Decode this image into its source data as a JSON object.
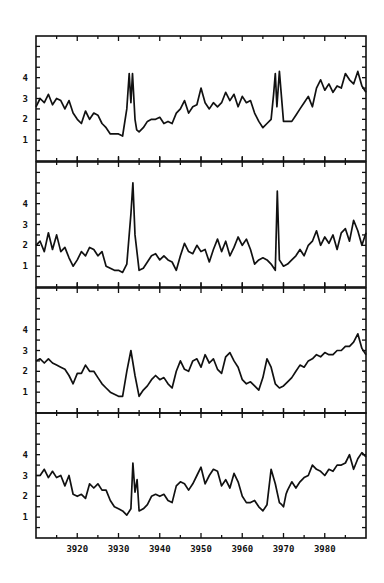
{
  "chart_data": [
    {
      "type": "line",
      "panel": 1,
      "title": "",
      "xlabel": "",
      "ylabel": "",
      "xlim": [
        3910,
        3990
      ],
      "ylim": [
        0,
        6
      ],
      "yticks": [
        1,
        2,
        3,
        4
      ],
      "x": [
        3910,
        3911,
        3912,
        3913,
        3914,
        3915,
        3916,
        3917,
        3918,
        3919,
        3920,
        3921,
        3922,
        3923,
        3924,
        3925,
        3926,
        3927,
        3928,
        3929,
        3930,
        3931,
        3932,
        3932.6,
        3933,
        3933.4,
        3934,
        3934.4,
        3935,
        3936,
        3937,
        3938,
        3939,
        3940,
        3941,
        3942,
        3943,
        3944,
        3945,
        3946,
        3947,
        3948,
        3949,
        3950,
        3951,
        3952,
        3953,
        3954,
        3955,
        3956,
        3957,
        3958,
        3959,
        3960,
        3961,
        3962,
        3963,
        3964,
        3965,
        3966,
        3967,
        3967.6,
        3968,
        3968.4,
        3969,
        3970,
        3971,
        3972,
        3973,
        3974,
        3975,
        3976,
        3977,
        3978,
        3979,
        3980,
        3981,
        3982,
        3983,
        3984,
        3985,
        3986,
        3987,
        3988,
        3989,
        3990
      ],
      "values": [
        2.6,
        3.0,
        2.8,
        3.2,
        2.7,
        3.0,
        2.9,
        2.5,
        2.9,
        2.3,
        2.0,
        1.8,
        2.4,
        2.0,
        2.3,
        2.2,
        1.8,
        1.6,
        1.3,
        1.3,
        1.3,
        1.2,
        2.5,
        4.2,
        2.8,
        4.2,
        2.0,
        1.5,
        1.4,
        1.6,
        1.9,
        2.0,
        2.0,
        2.1,
        1.8,
        1.9,
        1.8,
        2.3,
        2.5,
        2.9,
        2.3,
        2.6,
        2.7,
        3.5,
        2.8,
        2.5,
        2.8,
        2.6,
        2.8,
        3.3,
        2.9,
        3.2,
        2.6,
        3.1,
        2.8,
        2.9,
        2.3,
        1.9,
        1.6,
        1.8,
        2.0,
        3.2,
        4.2,
        2.6,
        4.3,
        1.9,
        1.9,
        1.9,
        2.2,
        2.5,
        2.8,
        3.1,
        2.6,
        3.5,
        3.9,
        3.4,
        3.7,
        3.3,
        3.6,
        3.5,
        4.2,
        3.9,
        3.7,
        4.3,
        3.6,
        3.3
      ]
    },
    {
      "type": "line",
      "panel": 2,
      "xlim": [
        3910,
        3990
      ],
      "ylim": [
        0,
        6
      ],
      "yticks": [
        1,
        2,
        3,
        4
      ],
      "x": [
        3910,
        3911,
        3912,
        3913,
        3914,
        3915,
        3916,
        3917,
        3918,
        3919,
        3920,
        3921,
        3922,
        3923,
        3924,
        3925,
        3926,
        3927,
        3928,
        3929,
        3930,
        3931,
        3932,
        3933,
        3933.5,
        3934,
        3935,
        3936,
        3937,
        3938,
        3939,
        3940,
        3941,
        3942,
        3943,
        3944,
        3945,
        3946,
        3947,
        3948,
        3949,
        3950,
        3951,
        3952,
        3953,
        3954,
        3955,
        3956,
        3957,
        3958,
        3959,
        3960,
        3961,
        3962,
        3963,
        3964,
        3965,
        3966,
        3967,
        3968,
        3968.5,
        3969,
        3970,
        3971,
        3972,
        3973,
        3974,
        3975,
        3976,
        3977,
        3978,
        3979,
        3980,
        3981,
        3982,
        3983,
        3984,
        3985,
        3986,
        3987,
        3988,
        3989,
        3990
      ],
      "values": [
        2.0,
        2.2,
        1.7,
        2.6,
        1.8,
        2.5,
        1.7,
        1.9,
        1.4,
        1.0,
        1.3,
        1.7,
        1.5,
        1.9,
        1.8,
        1.5,
        1.7,
        1.0,
        0.9,
        0.8,
        0.8,
        0.7,
        1.1,
        3.5,
        5.0,
        2.5,
        0.8,
        0.9,
        1.2,
        1.5,
        1.6,
        1.3,
        1.5,
        1.3,
        1.2,
        0.8,
        1.5,
        2.1,
        1.7,
        1.6,
        2.0,
        1.7,
        1.8,
        1.2,
        1.8,
        2.3,
        1.7,
        2.2,
        1.5,
        1.9,
        2.4,
        2.0,
        2.3,
        1.8,
        1.1,
        1.3,
        1.4,
        1.3,
        1.1,
        0.8,
        4.6,
        1.3,
        1.0,
        1.1,
        1.3,
        1.5,
        1.8,
        1.5,
        2.0,
        2.2,
        2.7,
        2.0,
        2.4,
        2.1,
        2.5,
        1.8,
        2.6,
        2.8,
        2.2,
        3.2,
        2.7,
        2.0,
        2.6
      ]
    },
    {
      "type": "line",
      "panel": 3,
      "xlim": [
        3910,
        3990
      ],
      "ylim": [
        0,
        6
      ],
      "yticks": [
        1,
        2,
        3,
        4
      ],
      "x": [
        3910,
        3911,
        3912,
        3913,
        3914,
        3915,
        3916,
        3917,
        3918,
        3919,
        3920,
        3921,
        3922,
        3923,
        3924,
        3925,
        3926,
        3927,
        3928,
        3929,
        3930,
        3931,
        3932,
        3933,
        3934,
        3935,
        3936,
        3937,
        3938,
        3939,
        3940,
        3941,
        3942,
        3943,
        3944,
        3945,
        3946,
        3947,
        3948,
        3949,
        3950,
        3951,
        3952,
        3953,
        3954,
        3955,
        3956,
        3957,
        3958,
        3959,
        3960,
        3961,
        3962,
        3963,
        3964,
        3965,
        3966,
        3967,
        3968,
        3969,
        3970,
        3971,
        3972,
        3973,
        3974,
        3975,
        3976,
        3977,
        3978,
        3979,
        3980,
        3981,
        3982,
        3983,
        3984,
        3985,
        3986,
        3987,
        3988,
        3989,
        3990
      ],
      "values": [
        2.5,
        2.6,
        2.4,
        2.6,
        2.4,
        2.3,
        2.2,
        2.1,
        1.8,
        1.4,
        1.9,
        1.9,
        2.3,
        2.0,
        2.0,
        1.7,
        1.4,
        1.2,
        1.0,
        0.9,
        0.8,
        0.8,
        2.0,
        3.0,
        1.8,
        0.8,
        1.1,
        1.3,
        1.6,
        1.8,
        1.6,
        1.7,
        1.4,
        1.2,
        2.0,
        2.5,
        2.1,
        2.0,
        2.5,
        2.6,
        2.2,
        2.8,
        2.4,
        2.6,
        2.1,
        1.9,
        2.7,
        2.9,
        2.5,
        2.2,
        1.6,
        1.4,
        1.5,
        1.3,
        1.1,
        1.7,
        2.6,
        2.2,
        1.4,
        1.2,
        1.3,
        1.5,
        1.7,
        2.0,
        2.3,
        2.2,
        2.5,
        2.6,
        2.8,
        2.7,
        2.9,
        2.8,
        2.8,
        3.0,
        3.0,
        3.2,
        3.2,
        3.4,
        3.8,
        3.1,
        2.8
      ]
    },
    {
      "type": "line",
      "panel": 4,
      "xlim": [
        3910,
        3990
      ],
      "ylim": [
        0,
        6
      ],
      "yticks": [
        1,
        2,
        3,
        4
      ],
      "xticks": [
        3920,
        3930,
        3940,
        3950,
        3960,
        3970,
        3980
      ],
      "xtick_labels": [
        "3920",
        "3930",
        "3940",
        "3950",
        "3960",
        "3970",
        "3980"
      ],
      "x": [
        3910,
        3911,
        3912,
        3913,
        3914,
        3915,
        3916,
        3917,
        3918,
        3919,
        3920,
        3921,
        3922,
        3923,
        3924,
        3925,
        3926,
        3927,
        3928,
        3929,
        3930,
        3931,
        3932,
        3933,
        3933.5,
        3934,
        3934.5,
        3935,
        3936,
        3937,
        3938,
        3939,
        3940,
        3941,
        3942,
        3943,
        3944,
        3945,
        3946,
        3947,
        3948,
        3949,
        3950,
        3951,
        3952,
        3953,
        3954,
        3955,
        3956,
        3957,
        3958,
        3959,
        3960,
        3961,
        3962,
        3963,
        3964,
        3965,
        3966,
        3967,
        3968,
        3969,
        3969.6,
        3970,
        3970.6,
        3971,
        3972,
        3973,
        3974,
        3975,
        3976,
        3977,
        3978,
        3979,
        3980,
        3981,
        3982,
        3983,
        3984,
        3985,
        3986,
        3987,
        3988,
        3989,
        3990
      ],
      "values": [
        3.0,
        3.0,
        3.3,
        2.9,
        3.2,
        2.9,
        3.0,
        2.5,
        3.0,
        2.1,
        2.0,
        2.1,
        1.9,
        2.6,
        2.4,
        2.6,
        2.3,
        2.3,
        1.8,
        1.5,
        1.4,
        1.3,
        1.1,
        1.4,
        3.6,
        2.2,
        2.8,
        1.3,
        1.4,
        1.6,
        2.0,
        2.1,
        2.0,
        2.1,
        1.8,
        1.7,
        2.5,
        2.7,
        2.6,
        2.3,
        2.6,
        3.0,
        3.4,
        2.6,
        3.0,
        3.3,
        3.2,
        2.5,
        2.8,
        2.4,
        3.1,
        2.7,
        2.0,
        1.7,
        1.7,
        1.8,
        1.5,
        1.3,
        1.6,
        3.3,
        2.6,
        1.7,
        1.6,
        1.5,
        2.1,
        2.3,
        2.7,
        2.4,
        2.7,
        2.9,
        3.0,
        3.5,
        3.3,
        3.2,
        3.0,
        3.3,
        3.2,
        3.5,
        3.5,
        3.6,
        4.0,
        3.3,
        3.8,
        4.1,
        3.9
      ]
    }
  ]
}
